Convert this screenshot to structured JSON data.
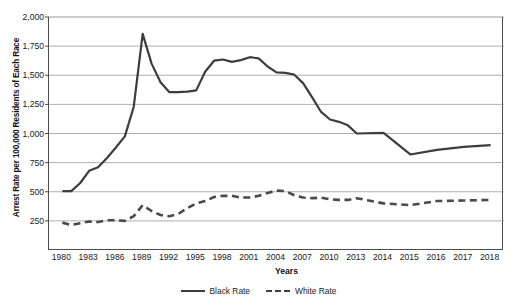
{
  "chart_data": {
    "type": "line",
    "title": "",
    "xlabel": "Years",
    "ylabel": "Arrest Rate per 100,000 Residents of Each Race",
    "ylim": [
      0,
      2000
    ],
    "grid": true,
    "legend_position": "bottom",
    "y_ticks": [
      250,
      500,
      750,
      1000,
      1250,
      1500,
      1750,
      2000
    ],
    "y_tick_labels": [
      "250",
      "500",
      "750",
      "1,000",
      "1,250",
      "1,500",
      "1,750",
      "2,000"
    ],
    "x_tick_labels": [
      "1980",
      "1983",
      "1986",
      "1989",
      "1992",
      "1995",
      "1998",
      "2001",
      "2004",
      "2007",
      "2010",
      "2013",
      "2014",
      "2015",
      "2016",
      "2017",
      "2018"
    ],
    "categories": [
      "1980",
      "1981",
      "1982",
      "1983",
      "1984",
      "1985",
      "1986",
      "1987",
      "1988",
      "1989",
      "1990",
      "1991",
      "1992",
      "1993",
      "1994",
      "1995",
      "1996",
      "1997",
      "1998",
      "1999",
      "2000",
      "2001",
      "2002",
      "2003",
      "2004",
      "2005",
      "2006",
      "2007",
      "2008",
      "2009",
      "2010",
      "2011",
      "2012",
      "2013",
      "2014",
      "2015",
      "2016",
      "2017",
      "2018"
    ],
    "series": [
      {
        "name": "Black Rate",
        "style": "solid",
        "color": "#3d3d3d",
        "values": [
          505,
          505,
          575,
          680,
          710,
          790,
          880,
          975,
          1230,
          1855,
          1600,
          1440,
          1355,
          1355,
          1360,
          1370,
          1530,
          1625,
          1635,
          1615,
          1630,
          1655,
          1645,
          1575,
          1525,
          1520,
          1505,
          1430,
          1310,
          1185,
          1120,
          1100,
          1070,
          1000,
          1005,
          820,
          860,
          885,
          900
        ]
      },
      {
        "name": "White Rate",
        "style": "dashed",
        "color": "#4a4a4a",
        "values": [
          235,
          215,
          230,
          245,
          240,
          255,
          255,
          250,
          290,
          385,
          335,
          300,
          290,
          310,
          360,
          400,
          420,
          455,
          465,
          465,
          450,
          450,
          465,
          490,
          510,
          505,
          470,
          450,
          445,
          450,
          435,
          430,
          430,
          445,
          400,
          385,
          420,
          425,
          430
        ]
      }
    ]
  },
  "legend": {
    "items": [
      {
        "label": "Black Rate",
        "style": "solid"
      },
      {
        "label": "White Rate",
        "style": "dashed"
      }
    ]
  }
}
